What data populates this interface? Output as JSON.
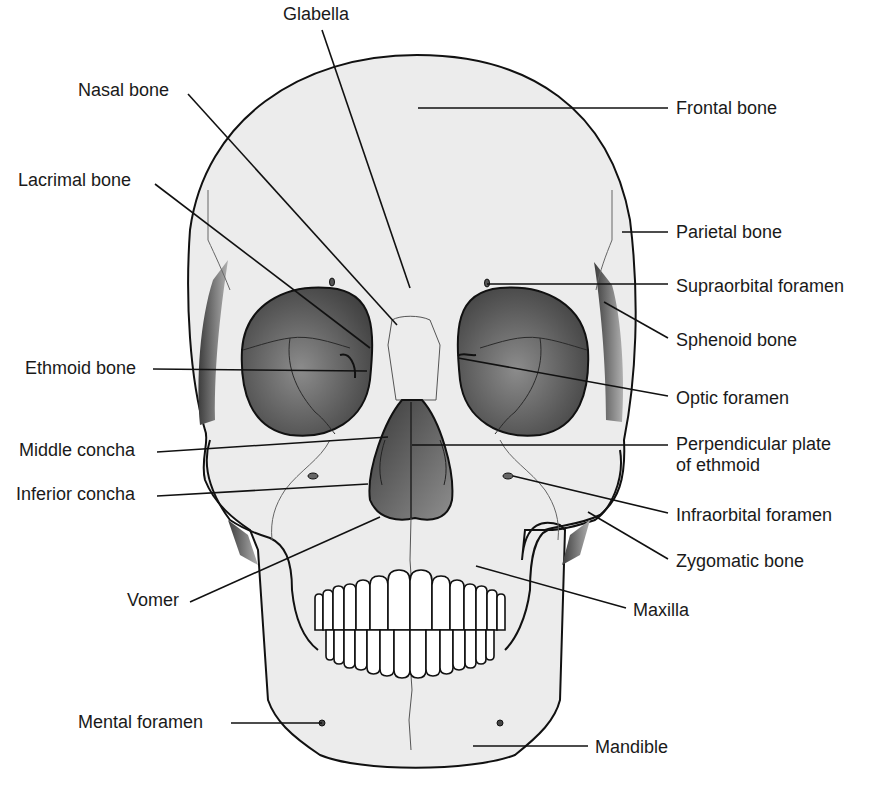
{
  "figure": {
    "colors": {
      "bone_fill": "#ececec",
      "outline": "#111111",
      "cavity_dark": "#3a3a3a",
      "cavity_light": "#9a9a9a",
      "suture": "#555555",
      "teeth": "#ffffff"
    }
  },
  "labels": [
    {
      "id": "glabella",
      "text": "Glabella",
      "x": 283,
      "y": 4,
      "align": "left",
      "line": [
        [
          322,
          30
        ],
        [
          410,
          288
        ]
      ]
    },
    {
      "id": "nasal-bone",
      "text": "Nasal bone",
      "x": 78,
      "y": 80,
      "align": "left",
      "line": [
        [
          188,
          94
        ],
        [
          397,
          325
        ]
      ]
    },
    {
      "id": "frontal-bone",
      "text": "Frontal bone",
      "x": 676,
      "y": 98,
      "align": "left",
      "line": [
        [
          418,
          108
        ],
        [
          668,
          108
        ]
      ]
    },
    {
      "id": "lacrimal-bone",
      "text": "Lacrimal bone",
      "x": 18,
      "y": 170,
      "align": "left",
      "line": [
        [
          155,
          184
        ],
        [
          370,
          348
        ]
      ]
    },
    {
      "id": "parietal-bone",
      "text": "Parietal bone",
      "x": 676,
      "y": 222,
      "align": "left",
      "line": [
        [
          622,
          232
        ],
        [
          668,
          232
        ]
      ]
    },
    {
      "id": "supraorbital-foramen",
      "text": "Supraorbital foramen",
      "x": 676,
      "y": 276,
      "align": "left",
      "line": [
        [
          487,
          284
        ],
        [
          668,
          284
        ]
      ]
    },
    {
      "id": "sphenoid-bone",
      "text": "Sphenoid bone",
      "x": 676,
      "y": 330,
      "align": "left",
      "line": [
        [
          604,
          302
        ],
        [
          668,
          338
        ]
      ]
    },
    {
      "id": "ethmoid-bone",
      "text": "Ethmoid bone",
      "x": 25,
      "y": 358,
      "align": "left",
      "line": [
        [
          153,
          369
        ],
        [
          367,
          371
        ]
      ]
    },
    {
      "id": "optic-foramen",
      "text": "Optic foramen",
      "x": 676,
      "y": 388,
      "align": "left",
      "line": [
        [
          458,
          358
        ],
        [
          668,
          396
        ]
      ]
    },
    {
      "id": "middle-concha",
      "text": "Middle concha",
      "x": 19,
      "y": 440,
      "align": "left",
      "line": [
        [
          157,
          452
        ],
        [
          388,
          437
        ]
      ]
    },
    {
      "id": "perpendicular-plate",
      "text": "Perpendicular plate\nof ethmoid",
      "x": 676,
      "y": 434,
      "align": "left",
      "line": [
        [
          412,
          445
        ],
        [
          668,
          445
        ]
      ]
    },
    {
      "id": "inferior-concha",
      "text": "Inferior concha",
      "x": 16,
      "y": 484,
      "align": "left",
      "line": [
        [
          157,
          496
        ],
        [
          368,
          484
        ]
      ]
    },
    {
      "id": "infraorbital-foramen",
      "text": "Infraorbital foramen",
      "x": 676,
      "y": 505,
      "align": "left",
      "line": [
        [
          513,
          476
        ],
        [
          668,
          513
        ]
      ]
    },
    {
      "id": "zygomatic-bone",
      "text": "Zygomatic bone",
      "x": 676,
      "y": 551,
      "align": "left",
      "line": [
        [
          588,
          512
        ],
        [
          668,
          559
        ]
      ]
    },
    {
      "id": "vomer",
      "text": "Vomer",
      "x": 127,
      "y": 590,
      "align": "left",
      "line": [
        [
          190,
          602
        ],
        [
          380,
          517
        ]
      ]
    },
    {
      "id": "maxilla",
      "text": "Maxilla",
      "x": 633,
      "y": 600,
      "align": "left",
      "line": [
        [
          476,
          566
        ],
        [
          626,
          608
        ]
      ]
    },
    {
      "id": "mental-foramen",
      "text": "Mental foramen",
      "x": 78,
      "y": 712,
      "align": "left",
      "line": [
        [
          231,
          723
        ],
        [
          322,
          723
        ]
      ]
    },
    {
      "id": "mandible",
      "text": "Mandible",
      "x": 595,
      "y": 737,
      "align": "left",
      "line": [
        [
          473,
          746
        ],
        [
          588,
          746
        ]
      ]
    }
  ]
}
